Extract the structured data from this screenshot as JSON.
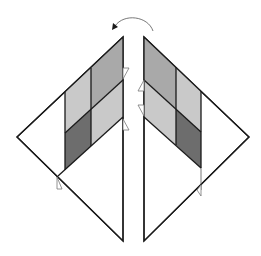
{
  "diagram": {
    "colors": {
      "light_gray": "#c9c9c9",
      "medium_gray": "#a9a9a9",
      "dark_gray": "#6d6d6d",
      "line": "#1a1a1a",
      "background": "#ffffff"
    },
    "arrow": {
      "type": "curved-flip-arrow",
      "direction": "right-to-left"
    },
    "left_piece": {
      "cells": [
        {
          "row": "upper",
          "col": "inner",
          "shade": "light_gray"
        },
        {
          "row": "upper",
          "col": "outer",
          "shade": "medium_gray"
        },
        {
          "row": "lower",
          "col": "inner",
          "shade": "dark_gray"
        },
        {
          "row": "lower",
          "col": "outer",
          "shade": "light_gray"
        }
      ]
    },
    "right_piece": {
      "cells": [
        {
          "row": "upper",
          "col": "inner",
          "shade": "medium_gray"
        },
        {
          "row": "upper",
          "col": "outer",
          "shade": "light_gray"
        },
        {
          "row": "lower",
          "col": "inner",
          "shade": "light_gray"
        },
        {
          "row": "lower",
          "col": "outer",
          "shade": "dark_gray"
        }
      ]
    }
  }
}
